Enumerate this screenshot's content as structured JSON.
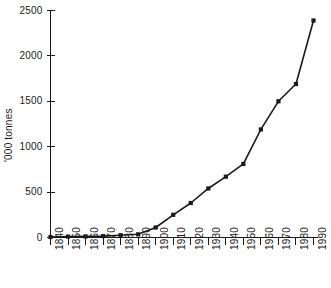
{
  "chart_data": {
    "type": "line",
    "title": "",
    "xlabel": "",
    "ylabel": "'000 tonnes",
    "xlim": [
      1840,
      1990
    ],
    "ylim": [
      0,
      2500
    ],
    "grid": false,
    "legend": "none",
    "marker": "square",
    "line_color": "#1a1a1a",
    "marker_color": "#1a1a1a",
    "background_color": "#ffffff",
    "x": [
      1840,
      1850,
      1860,
      1870,
      1880,
      1890,
      1900,
      1910,
      1920,
      1930,
      1940,
      1950,
      1960,
      1970,
      1980,
      1990
    ],
    "values": [
      5,
      10,
      12,
      15,
      25,
      35,
      110,
      250,
      380,
      540,
      670,
      810,
      1190,
      1500,
      1690,
      2390
    ],
    "categories": [
      "1840",
      "1850",
      "1860",
      "1870",
      "1880",
      "1890",
      "1900",
      "1910",
      "1920",
      "1930",
      "1940",
      "1950",
      "1960",
      "1970",
      "1980",
      "1990"
    ],
    "yticks": [
      0,
      500,
      1000,
      1500,
      2000,
      2500
    ],
    "ytick_labels": [
      "0",
      "500",
      "1000",
      "1500",
      "2000",
      "2500"
    ],
    "xticks": [
      1840,
      1850,
      1860,
      1870,
      1880,
      1890,
      1900,
      1910,
      1920,
      1930,
      1940,
      1950,
      1960,
      1970,
      1980,
      1990
    ],
    "xtick_labels": [
      "1840",
      "1850",
      "1860",
      "1870",
      "1880",
      "1890",
      "1900",
      "1910",
      "1920",
      "1930",
      "1940",
      "1950",
      "1960",
      "1970",
      "1980",
      "1990"
    ]
  }
}
